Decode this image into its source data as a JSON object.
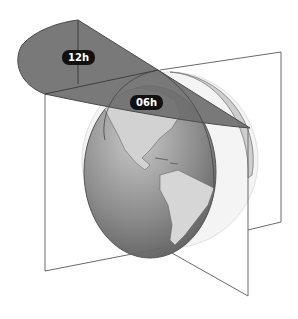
{
  "diagram": {
    "labels": [
      {
        "id": "label-12h",
        "text": "12h"
      },
      {
        "id": "label-06h",
        "text": "06h"
      }
    ],
    "colors": {
      "background": "#ffffff",
      "sector_fill": "#6e6e6e",
      "label_bg": "#111111",
      "label_text": "#ffffff",
      "plane_stroke": "#6a6a6a",
      "ocean_light": "#b8b8b8",
      "ocean_dark": "#5e5e5e",
      "land": "#d4d4d4"
    }
  }
}
